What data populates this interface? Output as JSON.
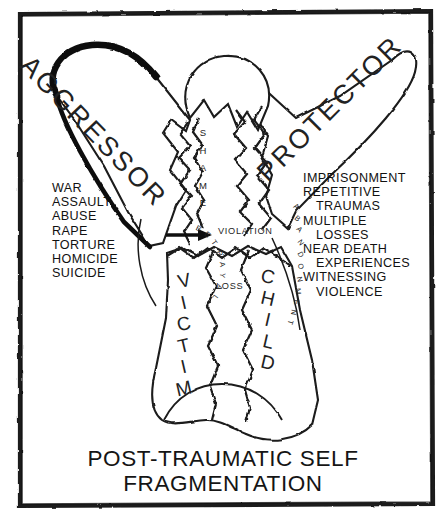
{
  "figure": {
    "title_line1": "POST-TRAUMATIC SELF",
    "title_line2": "FRAGMENTATION",
    "frame": {
      "border_color": "#1a1a1a",
      "background": "#ffffff"
    },
    "ink_color": "#1a1a1a"
  },
  "parts": {
    "aggressor": "AGGRESSOR",
    "protector": "PROTECTOR",
    "victim": "VICTIM",
    "child": "CHILD",
    "shame": "SHAME"
  },
  "fracture_labels": {
    "violation": "VIOLATION",
    "loss": "LOSS",
    "betrayal": "BETRAYAL",
    "abandonment": "ABANDONMENT"
  },
  "left_list": {
    "items": [
      {
        "text": "WAR",
        "indent": false
      },
      {
        "text": "ASSAULT",
        "indent": false
      },
      {
        "text": "ABUSE",
        "indent": false
      },
      {
        "text": "RAPE",
        "indent": false
      },
      {
        "text": "TORTURE",
        "indent": false
      },
      {
        "text": "HOMICIDE",
        "indent": false
      },
      {
        "text": "SUICIDE",
        "indent": false
      }
    ]
  },
  "right_list": {
    "items": [
      {
        "text": "IMPRISONMENT",
        "indent": false
      },
      {
        "text": "REPETITIVE",
        "indent": false
      },
      {
        "text": "TRAUMAS",
        "indent": true
      },
      {
        "text": "MULTIPLE",
        "indent": false
      },
      {
        "text": "LOSSES",
        "indent": true
      },
      {
        "text": "NEAR DEATH",
        "indent": false
      },
      {
        "text": "EXPERIENCES",
        "indent": true
      },
      {
        "text": "WITNESSING",
        "indent": false
      },
      {
        "text": "VIOLENCE",
        "indent": true
      }
    ]
  },
  "arrow": {
    "name": "violation-arrow",
    "direction": "right"
  }
}
